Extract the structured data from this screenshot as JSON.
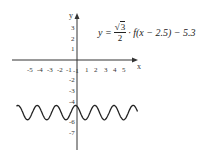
{
  "chart_data": {
    "type": "line",
    "title": "",
    "formula": {
      "lhs": "y =",
      "numerator": "3",
      "sqrt_symbol": "√",
      "denominator": "2",
      "rest": "· f(x − 2.5) − 5.3"
    },
    "xlabel": "x",
    "ylabel": "y",
    "x_ticks": [
      "-5",
      "-4",
      "-3",
      "-2",
      "-1",
      "1",
      "2",
      "3",
      "4",
      "5"
    ],
    "y_ticks": [
      "3",
      "2",
      "1",
      "-1",
      "-2",
      "-3",
      "-4",
      "-6",
      "-7"
    ],
    "xlim": [
      -6.5,
      6.5
    ],
    "ylim": [
      -9,
      4
    ],
    "grid": false,
    "series": [
      {
        "name": "y = (√3/2)·f(x−2.5)−5.3",
        "description": "sinusoidal wave oscillating between about -4.6 and -6.0 with period about 2",
        "center": -5.3,
        "amplitude": 0.7,
        "period": 2,
        "x_range": [
          -6.3,
          6.3
        ],
        "color": "#222222"
      }
    ]
  }
}
